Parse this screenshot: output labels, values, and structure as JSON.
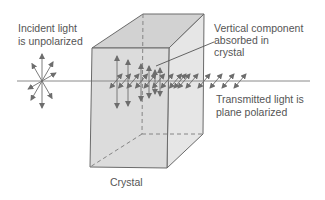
{
  "labels": {
    "incident": [
      "Incident light",
      "is unpolarized"
    ],
    "absorbed": [
      "Vertical component",
      "absorbed in",
      "crystal"
    ],
    "transmitted": [
      "Transmitted light is",
      "plane polarized"
    ],
    "crystal": "Crystal"
  },
  "colors": {
    "crystal_fill": "#dcdcdc",
    "crystal_side": "#e6e6e6",
    "crystal_top": "#d2d2d2",
    "edge": "#6a6a6a",
    "arrow": "#6d6d6d",
    "beam": "#8a8a8a",
    "text": "#555555"
  },
  "components": {
    "incident_directions": 8,
    "vertical_vectors_in_crystal": 6,
    "horizontal_vectors_in_crystal": 9,
    "transmitted_vectors": 6
  }
}
